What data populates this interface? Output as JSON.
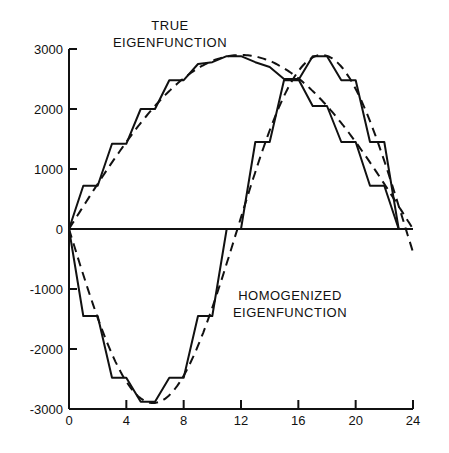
{
  "chart_data": {
    "type": "line",
    "title": "",
    "xlabel": "",
    "ylabel": "",
    "xlim": [
      0,
      24
    ],
    "ylim": [
      -3000,
      3000
    ],
    "grid": false,
    "x_ticks": [
      0,
      4,
      8,
      12,
      16,
      20,
      24
    ],
    "x_tick_labels": [
      "0",
      "4",
      "8",
      "12",
      "16",
      "20",
      "24"
    ],
    "y_ticks": [
      3000,
      2000,
      1000,
      0,
      -1000,
      -2000,
      -3000
    ],
    "y_tick_labels": [
      "3000",
      "2000",
      "1000",
      "0",
      "-1000",
      "-2000",
      "-3000"
    ],
    "annotations": [
      {
        "lines": [
          "TRUE",
          "EIGENFUNCTION"
        ],
        "near": "top-center"
      },
      {
        "lines": [
          "HOMOGENIZED",
          "EIGENFUNCTION"
        ],
        "near": "center-right below zero line"
      }
    ],
    "series": [
      {
        "name": "True eigenfunction (stepped)",
        "style": "solid",
        "x": [
          0,
          1,
          2,
          3,
          4,
          5,
          6,
          7,
          8,
          9,
          10,
          11,
          12,
          13,
          14,
          15,
          16,
          17,
          18,
          19,
          20,
          21,
          22,
          23
        ],
        "y": [
          0,
          720,
          720,
          1420,
          1420,
          2000,
          2000,
          2480,
          2480,
          2750,
          2780,
          2880,
          2880,
          2780,
          2700,
          2500,
          2500,
          2050,
          2050,
          1450,
          1450,
          720,
          720,
          0
        ]
      },
      {
        "name": "True eigenfunction (smooth)",
        "style": "dashed",
        "function": "2900*sin(pi*x/24)",
        "x_range": [
          0,
          24
        ]
      },
      {
        "name": "Homogenized eigenfunction (stepped)",
        "style": "solid",
        "x": [
          0,
          1,
          2,
          3,
          4,
          5,
          6,
          7,
          8,
          9,
          10,
          11,
          12,
          13,
          14,
          15,
          16,
          17,
          18,
          19,
          20,
          21,
          22,
          23,
          24
        ],
        "y": [
          0,
          -1450,
          -1450,
          -2480,
          -2480,
          -2880,
          -2880,
          -2480,
          -2480,
          -1450,
          -1450,
          0,
          0,
          1450,
          1450,
          2480,
          2480,
          2880,
          2880,
          2480,
          2480,
          1450,
          1450,
          0,
          0
        ]
      },
      {
        "name": "Homogenized eigenfunction (smooth)",
        "style": "dashed",
        "function": "-2900*sin(2*pi*x/23.5)",
        "x_range": [
          0,
          24
        ]
      }
    ]
  }
}
